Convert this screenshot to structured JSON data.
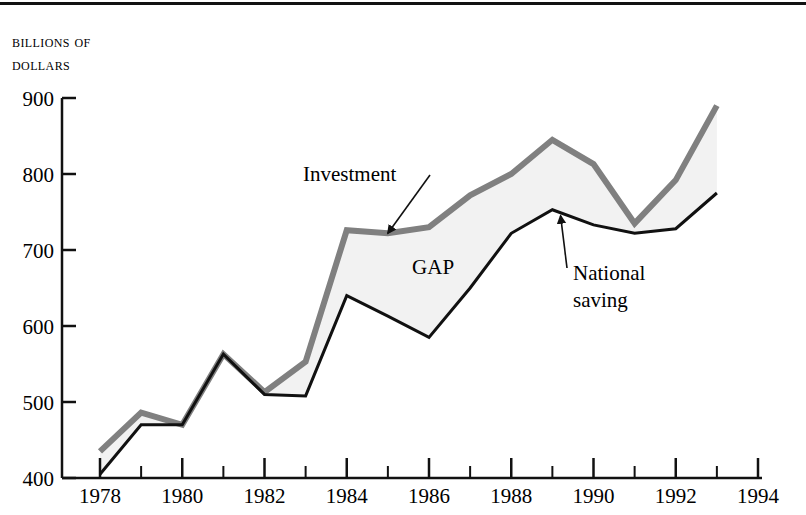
{
  "figure": {
    "axis_title": "Billions of\ndollars",
    "top_rule": true
  },
  "chart_data": {
    "type": "line",
    "title": "",
    "subtitle": "",
    "xlabel": "",
    "ylabel": "Billions of dollars",
    "xlim": [
      1978,
      1994
    ],
    "ylim": [
      400,
      900
    ],
    "grid": false,
    "legend_position": "inline-annotations",
    "x": [
      1978,
      1979,
      1980,
      1981,
      1982,
      1983,
      1984,
      1985,
      1986,
      1987,
      1988,
      1989,
      1990,
      1991,
      1992,
      1993
    ],
    "xticks_major": [
      1978,
      1980,
      1982,
      1984,
      1986,
      1988,
      1990,
      1992,
      1994
    ],
    "xticks_minor": [
      1979,
      1981,
      1983,
      1985,
      1987,
      1989,
      1991,
      1993
    ],
    "yticks": [
      400,
      500,
      600,
      700,
      800,
      900
    ],
    "series": [
      {
        "name": "Investment",
        "color": "#808080",
        "line_width": 6,
        "values": [
          435,
          486,
          470,
          563,
          513,
          553,
          726,
          722,
          730,
          772,
          800,
          845,
          813,
          735,
          792,
          890
        ]
      },
      {
        "name": "National saving",
        "color": "#111111",
        "line_width": 3,
        "values": [
          405,
          470,
          470,
          563,
          510,
          508,
          640,
          613,
          585,
          650,
          722,
          753,
          733,
          722,
          728,
          775
        ]
      }
    ],
    "fill": {
      "label": "GAP",
      "color": "#f2f2f2",
      "between": [
        "Investment",
        "National saving"
      ]
    },
    "annotations": [
      {
        "label": "Investment",
        "anchor_year": 1985.0,
        "anchor_value": 722
      },
      {
        "label": "National saving",
        "anchor_year": 1989.2,
        "anchor_value": 745
      },
      {
        "label": "GAP",
        "anchor_year": 1986.1,
        "anchor_value": 668
      }
    ]
  },
  "axis_tick_labels": {
    "y": [
      "900",
      "800",
      "700",
      "600",
      "500",
      "400"
    ],
    "x": [
      "1978",
      "1980",
      "1982",
      "1984",
      "1986",
      "1988",
      "1990",
      "1992",
      "1994"
    ]
  },
  "annotation_labels": {
    "investment": "Investment",
    "national_saving_line1": "National",
    "national_saving_line2": "saving",
    "gap": "GAP"
  }
}
